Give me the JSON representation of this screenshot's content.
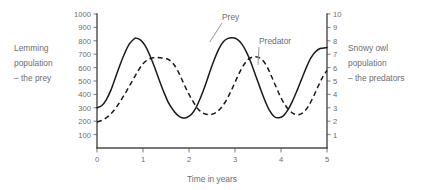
{
  "chart_data": {
    "type": "line",
    "title": "",
    "xlabel": "Time in years",
    "ylabel": "Lemming population – the prey",
    "y2label": "Snowy owl population – the predators",
    "xlim": [
      0,
      5
    ],
    "ylim": [
      0,
      1000
    ],
    "y2lim": [
      0,
      10
    ],
    "grid": false,
    "legend_position": "inline-annotations",
    "xticks": [
      "0",
      "1",
      "2",
      "3",
      "4",
      "5"
    ],
    "xtick_values": [
      0,
      1,
      2,
      3,
      4,
      5
    ],
    "yticks": [
      "100",
      "200",
      "300",
      "400",
      "500",
      "600",
      "700",
      "800",
      "900",
      "1000"
    ],
    "ytick_values": [
      100,
      200,
      300,
      400,
      500,
      600,
      700,
      800,
      900,
      1000
    ],
    "y2ticks": [
      "1",
      "2",
      "3",
      "4",
      "5",
      "6",
      "7",
      "8",
      "9",
      "10"
    ],
    "y2tick_values": [
      1,
      2,
      3,
      4,
      5,
      6,
      7,
      8,
      9,
      10
    ],
    "annotations": [
      {
        "text": "Prey",
        "target_x": 2.45,
        "target_y": 790
      },
      {
        "text": "Predator",
        "target_x": 3.5,
        "target_y": 620
      }
    ],
    "series": [
      {
        "name": "Prey",
        "axis": "left",
        "style": "solid",
        "color": "#1a1a1a",
        "x": [
          0.0,
          0.1,
          0.2,
          0.3,
          0.4,
          0.5,
          0.6,
          0.7,
          0.8,
          0.85,
          0.95,
          1.05,
          1.15,
          1.25,
          1.35,
          1.45,
          1.55,
          1.65,
          1.75,
          1.85,
          1.95,
          2.05,
          2.15,
          2.25,
          2.35,
          2.45,
          2.55,
          2.65,
          2.75,
          2.85,
          2.95,
          3.05,
          3.15,
          3.25,
          3.35,
          3.45,
          3.55,
          3.65,
          3.75,
          3.85,
          3.95,
          4.05,
          4.15,
          4.25,
          4.35,
          4.45,
          4.55,
          4.65,
          4.75,
          4.85,
          5.0
        ],
        "y": [
          300,
          315,
          360,
          430,
          525,
          620,
          705,
          775,
          812,
          820,
          805,
          762,
          690,
          605,
          510,
          420,
          340,
          285,
          245,
          225,
          228,
          250,
          300,
          375,
          465,
          565,
          660,
          740,
          795,
          818,
          822,
          810,
          775,
          715,
          635,
          540,
          445,
          355,
          280,
          235,
          225,
          240,
          285,
          350,
          430,
          515,
          600,
          672,
          718,
          742,
          750
        ]
      },
      {
        "name": "Predator",
        "axis": "right",
        "style": "dashed",
        "color": "#1a1a1a",
        "x": [
          0.0,
          0.1,
          0.2,
          0.3,
          0.4,
          0.5,
          0.6,
          0.7,
          0.8,
          0.9,
          1.0,
          1.1,
          1.2,
          1.3,
          1.4,
          1.5,
          1.6,
          1.7,
          1.8,
          1.9,
          2.0,
          2.1,
          2.2,
          2.3,
          2.4,
          2.5,
          2.6,
          2.7,
          2.8,
          2.9,
          3.0,
          3.1,
          3.2,
          3.3,
          3.4,
          3.5,
          3.6,
          3.7,
          3.8,
          3.9,
          4.0,
          4.1,
          4.2,
          4.3,
          4.4,
          4.5,
          4.6,
          4.7,
          4.8,
          4.9,
          5.0
        ],
        "y": [
          195,
          205,
          225,
          255,
          295,
          345,
          400,
          460,
          520,
          580,
          628,
          658,
          672,
          675,
          672,
          668,
          650,
          610,
          545,
          470,
          400,
          340,
          290,
          262,
          250,
          252,
          268,
          300,
          350,
          415,
          490,
          565,
          625,
          665,
          680,
          678,
          655,
          605,
          530,
          450,
          375,
          315,
          275,
          252,
          250,
          270,
          315,
          380,
          455,
          525,
          580
        ]
      }
    ]
  },
  "labels": {
    "left_line1": "Lemming",
    "left_line2": "population",
    "left_line3": "– the prey",
    "right_line1": "Snowy owl",
    "right_line2": "population",
    "right_line3": "– the predators"
  },
  "colors": {
    "curve": "#1a1a1a",
    "axis": "#4a4a4a",
    "text": "#6e6e6e",
    "background": "#ffffff"
  }
}
